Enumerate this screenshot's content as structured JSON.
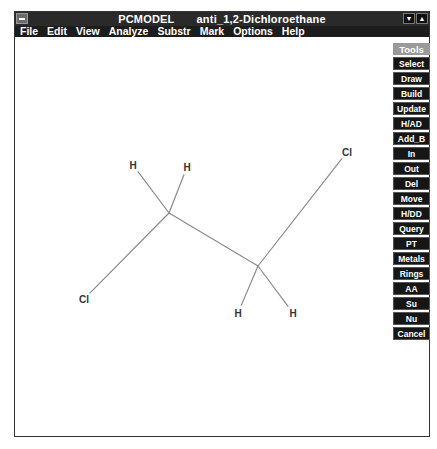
{
  "window": {
    "app_title": "PCMODEL",
    "document_title": "anti_1,2-Dichloroethane",
    "controls": {
      "minimize": "▼",
      "maximize": "▲"
    }
  },
  "menu": [
    "File",
    "Edit",
    "View",
    "Analyze",
    "Substr",
    "Mark",
    "Options",
    "Help"
  ],
  "tools": {
    "header": "Tools",
    "buttons": [
      "Select",
      "Draw",
      "Build",
      "Update",
      "H/AD",
      "Add_B",
      "In",
      "Out",
      "Del",
      "Move",
      "H/DD",
      "Query",
      "PT",
      "Metals",
      "Rings",
      "AA",
      "Su",
      "Nu",
      "Cancel"
    ]
  },
  "molecule": {
    "name": "anti_1,2-Dichloroethane",
    "atoms": [
      {
        "id": "C1",
        "label": "",
        "x": 169,
        "y": 213
      },
      {
        "id": "C2",
        "label": "",
        "x": 258,
        "y": 266
      },
      {
        "id": "H1",
        "label": "H",
        "x": 133,
        "y": 165
      },
      {
        "id": "H2",
        "label": "H",
        "x": 187,
        "y": 167
      },
      {
        "id": "Cl1",
        "label": "Cl",
        "x": 84,
        "y": 299
      },
      {
        "id": "Cl2",
        "label": "Cl",
        "x": 347,
        "y": 152
      },
      {
        "id": "H3",
        "label": "H",
        "x": 238,
        "y": 313
      },
      {
        "id": "H4",
        "label": "H",
        "x": 293,
        "y": 313
      }
    ],
    "bonds": [
      [
        "C1",
        "C2"
      ],
      [
        "C1",
        "H1"
      ],
      [
        "C1",
        "H2"
      ],
      [
        "C1",
        "Cl1"
      ],
      [
        "C2",
        "Cl2"
      ],
      [
        "C2",
        "H3"
      ],
      [
        "C2",
        "H4"
      ]
    ]
  }
}
